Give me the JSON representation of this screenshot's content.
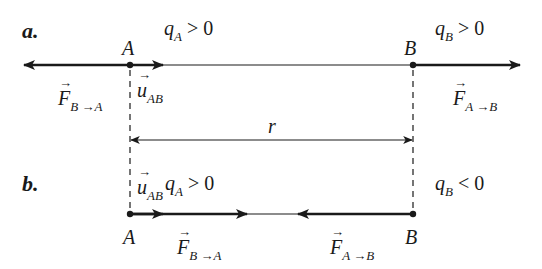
{
  "diagram": {
    "part_a": {
      "label": "a.",
      "point_A": "A",
      "point_B": "B",
      "qA": {
        "sym": "q",
        "sub": "A",
        "rel": " > 0"
      },
      "qB": {
        "sym": "q",
        "sub": "B",
        "rel": " > 0"
      },
      "force_on_A": {
        "sym": "F",
        "sub": "B →A"
      },
      "force_on_B": {
        "sym": "F",
        "sub": "A →B"
      },
      "unit_vector": {
        "sym": "u",
        "sub": "AB"
      }
    },
    "distance": {
      "label": "r"
    },
    "part_b": {
      "label": "b.",
      "point_A": "A",
      "point_B": "B",
      "qA": {
        "sym": "q",
        "sub": "A",
        "rel": " > 0"
      },
      "qB": {
        "sym": "q",
        "sub": "B",
        "rel": " < 0"
      },
      "force_on_A": {
        "sym": "F",
        "sub": "B →A"
      },
      "force_on_B": {
        "sym": "F",
        "sub": "A →B"
      },
      "unit_vector": {
        "sym": "u",
        "sub": "AB"
      }
    },
    "colors": {
      "ink": "#1a1a1a",
      "background": "#ffffff"
    }
  }
}
